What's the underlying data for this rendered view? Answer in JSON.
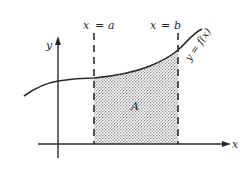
{
  "diagram": {
    "type": "definite-integral-area",
    "labels": {
      "y_axis": "y",
      "x_axis": "x",
      "line_a_var": "x",
      "line_a_eq": "=",
      "line_a_val": "a",
      "line_b_var": "x",
      "line_b_eq": "=",
      "line_b_val": "b",
      "curve": "y = f(x)",
      "area": "A"
    },
    "colors": {
      "ink": "#2a2a2a",
      "shading": "#8a8a8a",
      "background": "#ffffff"
    }
  }
}
